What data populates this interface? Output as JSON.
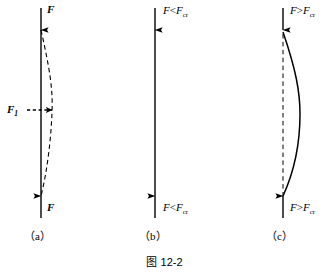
{
  "figure": {
    "caption": "图 12-2",
    "panels": [
      {
        "id": "a",
        "label": "（a）",
        "top_force_label": "F",
        "bottom_force_label": "F",
        "lateral_force_label": "F",
        "lateral_force_sub": "1",
        "column_state": "straight-solid",
        "deflection_curve": "dashed",
        "description": "Column with axial force F at both ends and lateral force F1 causing dashed bent shape"
      },
      {
        "id": "b",
        "label": "（b）",
        "top_force_label": "F",
        "top_force_op": "<",
        "top_force_crit": "F",
        "top_force_crit_sub": "cr",
        "bottom_force_label": "F",
        "bottom_force_op": "<",
        "bottom_force_crit": "F",
        "bottom_force_crit_sub": "cr",
        "column_state": "straight-solid",
        "deflection_curve": "none",
        "description": "Column remains straight when F is less than critical force"
      },
      {
        "id": "c",
        "label": "（c）",
        "top_force_label": "F",
        "top_force_op": ">",
        "top_force_crit": "F",
        "top_force_crit_sub": "cr",
        "bottom_force_label": "F",
        "bottom_force_op": ">",
        "bottom_force_crit": "F",
        "bottom_force_crit_sub": "cr",
        "column_state": "dashed-original",
        "deflection_curve": "solid",
        "description": "Column buckles into solid bowed shape when F exceeds critical force"
      }
    ],
    "colors": {
      "ink": "#000000",
      "background": "#ffffff"
    }
  }
}
